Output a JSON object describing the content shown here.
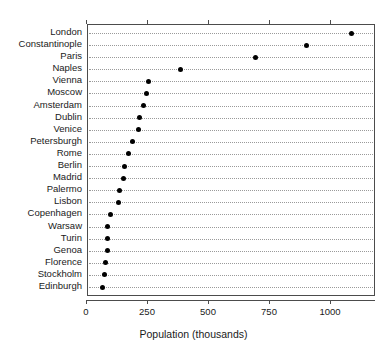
{
  "chart_data": {
    "type": "scatter",
    "subtype": "cleveland-dot-plot",
    "title": "",
    "xlabel": "Population (thousands)",
    "ylabel": "",
    "xlim": [
      0,
      1160
    ],
    "xticks": [
      0,
      250,
      500,
      750,
      1000
    ],
    "xticklabels": [
      "0",
      "250",
      "500",
      "750",
      "1000"
    ],
    "grid": "horizontal-dotted",
    "legend": "none",
    "orientation": "horizontal",
    "marker": "filled-circle",
    "marker_color": "#000000",
    "categories": [
      "London",
      "Constantinople",
      "Paris",
      "Naples",
      "Vienna",
      "Moscow",
      "Amsterdam",
      "Dublin",
      "Venice",
      "Petersburgh",
      "Rome",
      "Berlin",
      "Madrid",
      "Palermo",
      "Lisbon",
      "Copenhagen",
      "Warsaw",
      "Turin",
      "Genoa",
      "Florence",
      "Stockholm",
      "Edinburgh"
    ],
    "values": [
      1085,
      900,
      690,
      385,
      250,
      245,
      230,
      215,
      210,
      185,
      170,
      155,
      150,
      135,
      130,
      95,
      85,
      85,
      85,
      75,
      70,
      65
    ]
  },
  "axis": {
    "x_title": "Population (thousands)"
  }
}
